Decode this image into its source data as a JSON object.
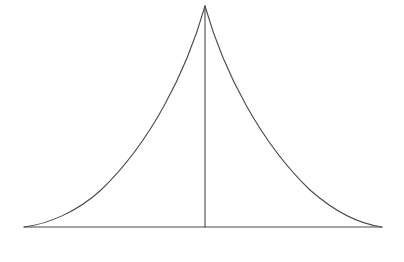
{
  "figure": {
    "title": "Concave-sided triangular tent figure with central vertical axis",
    "canvas": {
      "width": 404,
      "height": 262,
      "background_color": "#ffffff"
    },
    "style": {
      "stroke_color": "#4a4a4a",
      "stroke_width": 1.1,
      "fill": "none"
    },
    "points": {
      "apex": {
        "x": 205,
        "y": 6
      },
      "base_left": {
        "x": 24,
        "y": 227
      },
      "base_right": {
        "x": 382,
        "y": 227
      },
      "base_center": {
        "x": 205,
        "y": 227
      }
    },
    "paths": {
      "base_line": "M 24 227 L 382 227",
      "center_axis": "M 205 6 L 205 227",
      "left_curve": "M 205 6 C 186 73, 150 143, 101 190 C 77 212, 48 224, 24 227",
      "right_curve": "M 205 6 C 224 73, 261 143, 310 190 C 335 212, 360 224, 382 227"
    }
  },
  "chart_data": {
    "type": "line",
    "title": "Concave-sided triangular tent figure with central vertical axis",
    "xlabel": "",
    "ylabel": "",
    "xlim": [
      0,
      404
    ],
    "ylim": [
      262,
      0
    ],
    "grid": false,
    "legend": "none",
    "annotations": [],
    "tick_labels": {
      "x": [],
      "y": []
    },
    "series": [
      {
        "name": "left-curve",
        "kind": "curve",
        "note": "Concave curve from apex to bottom-left corner, steep near apex, flattening toward the base",
        "x": [
          205,
          195,
          186,
          175,
          163,
          152,
          140,
          124,
          108,
          92,
          72,
          52,
          36,
          24
        ],
        "y": [
          6,
          26,
          45,
          64,
          82,
          100,
          118,
          150,
          172,
          190,
          205,
          217,
          224,
          227
        ]
      },
      {
        "name": "right-curve",
        "kind": "curve",
        "note": "Mirror-image concave curve from apex to bottom-right corner",
        "x": [
          205,
          215,
          224,
          235,
          247,
          251,
          266,
          280,
          290,
          310,
          330,
          352,
          370,
          382
        ],
        "y": [
          6,
          26,
          45,
          64,
          82,
          90,
          112,
          140,
          160,
          185,
          203,
          216,
          224,
          227
        ]
      },
      {
        "name": "base-line",
        "kind": "straight",
        "note": "Horizontal base of the figure",
        "x": [
          24,
          382
        ],
        "y": [
          227,
          227
        ]
      },
      {
        "name": "center-axis",
        "kind": "straight",
        "note": "Vertical axis from apex to base midpoint",
        "x": [
          205,
          205
        ],
        "y": [
          6,
          227
        ]
      }
    ]
  }
}
